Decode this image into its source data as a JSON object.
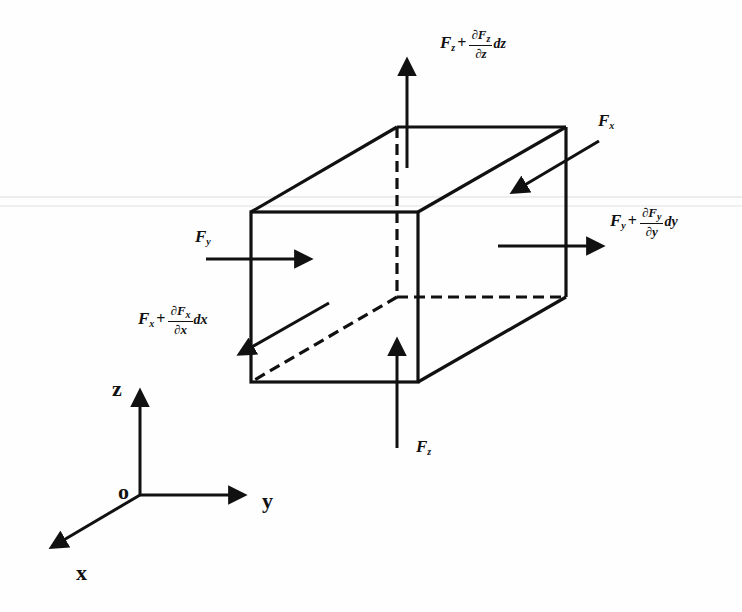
{
  "diagram": {
    "colors": {
      "stroke": "#111111",
      "background": "#fefefe",
      "scanline": "#d8d8d8"
    },
    "axes": {
      "origin_label": "o",
      "x_label": "x",
      "y_label": "y",
      "z_label": "z"
    },
    "forces": {
      "top": {
        "base": "F",
        "sub": "z",
        "plus": "+",
        "partial_num": "∂F",
        "partial_num_sub": "z",
        "partial_den": "∂z",
        "differential": "dz",
        "direction": "up (+z)"
      },
      "bottom": {
        "base": "F",
        "sub": "z",
        "direction": "up into bottom face"
      },
      "back_right": {
        "base": "F",
        "sub": "x",
        "direction": "toward -x... inward on back face"
      },
      "left": {
        "base": "F",
        "sub": "y",
        "direction": "+y into left face"
      },
      "right": {
        "base": "F",
        "sub": "y",
        "plus": "+",
        "partial_num": "∂F",
        "partial_num_sub": "y",
        "partial_den": "∂y",
        "differential": "dy",
        "direction": "+y out of right face"
      },
      "front": {
        "base": "F",
        "sub": "x",
        "plus": "+",
        "partial_num": "∂F",
        "partial_num_sub": "x",
        "partial_den": "∂x",
        "differential": "dx",
        "direction": "+x out of front face"
      }
    },
    "cube_vertices": {
      "front_top_left": [
        251,
        212
      ],
      "front_top_right": [
        418,
        212
      ],
      "front_bottom_left": [
        251,
        382
      ],
      "front_bottom_right": [
        418,
        382
      ],
      "back_top_left": [
        397,
        127
      ],
      "back_top_right": [
        566,
        127
      ],
      "back_bottom_left": [
        397,
        297
      ],
      "back_bottom_right": [
        566,
        297
      ]
    }
  }
}
